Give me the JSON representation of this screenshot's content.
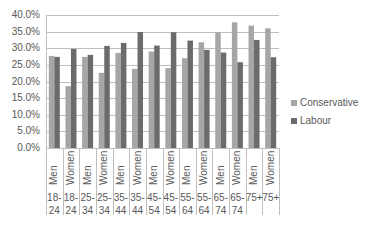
{
  "chart_data": {
    "type": "bar",
    "title": "",
    "xlabel": "",
    "ylabel": "",
    "ylim": [
      0,
      40
    ],
    "y_ticks": [
      "0.0%",
      "5.0%",
      "10.0%",
      "15.0%",
      "20.0%",
      "25.0%",
      "30.0%",
      "35.0%",
      "40.0%"
    ],
    "grid": true,
    "legend_position": "right",
    "categories": [
      {
        "gender": "Men",
        "age": "18-24"
      },
      {
        "gender": "Women",
        "age": "18-24"
      },
      {
        "gender": "Men",
        "age": "25-34"
      },
      {
        "gender": "Women",
        "age": "25-34"
      },
      {
        "gender": "Men",
        "age": "35-44"
      },
      {
        "gender": "Women",
        "age": "35-44"
      },
      {
        "gender": "Men",
        "age": "45-54"
      },
      {
        "gender": "Women",
        "age": "45-54"
      },
      {
        "gender": "Men",
        "age": "55-64"
      },
      {
        "gender": "Women",
        "age": "55-64"
      },
      {
        "gender": "Men",
        "age": "65-74"
      },
      {
        "gender": "Women",
        "age": "65-74"
      },
      {
        "gender": "Men",
        "age": "75+"
      },
      {
        "gender": "Women",
        "age": "75+"
      }
    ],
    "age_label_lines": [
      [
        "18-",
        "24"
      ],
      [
        "18-",
        "24"
      ],
      [
        "25-",
        "34"
      ],
      [
        "25-",
        "34"
      ],
      [
        "35-",
        "44"
      ],
      [
        "35-",
        "44"
      ],
      [
        "45-",
        "54"
      ],
      [
        "45-",
        "54"
      ],
      [
        "55-",
        "64"
      ],
      [
        "55-",
        "64"
      ],
      [
        "65-",
        "74"
      ],
      [
        "65-",
        "74"
      ],
      [
        "75+",
        ""
      ],
      [
        "75+",
        ""
      ]
    ],
    "series": [
      {
        "name": "Conservative",
        "color": "#a6a6a6",
        "values": [
          27.7,
          18.6,
          27.4,
          22.6,
          28.6,
          23.8,
          29.0,
          24.0,
          27.0,
          31.8,
          34.8,
          37.8,
          36.8,
          36.0
        ]
      },
      {
        "name": "Labour",
        "color": "#6b6b6b",
        "values": [
          27.4,
          29.8,
          28.0,
          30.7,
          31.6,
          34.9,
          30.8,
          34.8,
          32.3,
          29.5,
          28.7,
          25.8,
          32.5,
          27.3
        ]
      }
    ]
  },
  "legend": {
    "items": [
      {
        "label": "Conservative",
        "color": "#a6a6a6"
      },
      {
        "label": "Labour",
        "color": "#6b6b6b"
      }
    ]
  }
}
